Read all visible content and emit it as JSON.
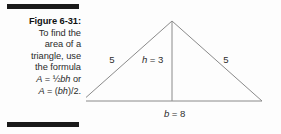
{
  "figure": {
    "label": "Figure 6-31:",
    "caption_lines": [
      "To find the",
      "area of a",
      "triangle, use",
      "the formula"
    ],
    "formula_1": "A = ½bh or",
    "formula_1_parts": {
      "lhs": "A",
      "equals": " = ",
      "fraction": "½",
      "vars": "bh",
      "conjunction": " or"
    },
    "formula_2": "A = (bh)/2.",
    "formula_2_parts": {
      "lhs": "A",
      "equals": " = (",
      "vars": "bh",
      "tail": ")/2."
    }
  },
  "diagram": {
    "type": "triangle",
    "labels": {
      "left_side": "5",
      "right_side": "5",
      "height": "h = 3",
      "height_var": "h",
      "height_value": "= 3",
      "base": "b = 8",
      "base_var": "b",
      "base_value": "= 8"
    },
    "measurements": {
      "base_length": 8,
      "height_length": 3,
      "equal_side_length": 5,
      "computed_area": 12
    },
    "colors": {
      "stroke": "#8a8a8a",
      "rule": "#1a1a1a",
      "text": "#2b2b2b",
      "background": "#fdfdfd"
    }
  }
}
